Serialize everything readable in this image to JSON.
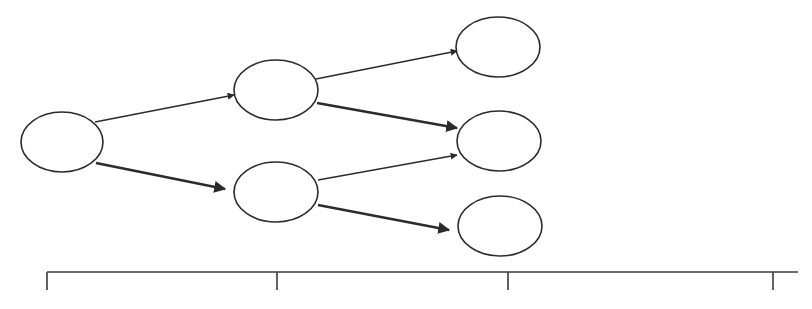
{
  "diagram": {
    "type": "tree",
    "colors": {
      "stroke": "#2b2b2b",
      "background": "#ffffff"
    },
    "nodes": [
      {
        "id": "n0",
        "label": "",
        "cx": 62,
        "cy": 142,
        "rx": 41,
        "ry": 30
      },
      {
        "id": "n1",
        "label": "",
        "cx": 276,
        "cy": 90,
        "rx": 42,
        "ry": 30
      },
      {
        "id": "n2",
        "label": "",
        "cx": 276,
        "cy": 192,
        "rx": 42,
        "ry": 30
      },
      {
        "id": "n3",
        "label": "",
        "cx": 498,
        "cy": 47,
        "rx": 42,
        "ry": 30
      },
      {
        "id": "n4",
        "label": "",
        "cx": 499,
        "cy": 141,
        "rx": 42,
        "ry": 30
      },
      {
        "id": "n5",
        "label": "",
        "cx": 500,
        "cy": 226,
        "rx": 42,
        "ry": 30
      }
    ],
    "edges": [
      {
        "from": "n0",
        "to": "n1",
        "weight": "thin",
        "x1": 95,
        "y1": 122,
        "x2": 234,
        "y2": 95
      },
      {
        "from": "n0",
        "to": "n2",
        "weight": "thick",
        "x1": 96,
        "y1": 163,
        "x2": 225,
        "y2": 189
      },
      {
        "from": "n1",
        "to": "n3",
        "weight": "thin",
        "x1": 316,
        "y1": 79,
        "x2": 457,
        "y2": 51
      },
      {
        "from": "n1",
        "to": "n4",
        "weight": "thick",
        "x1": 317,
        "y1": 103,
        "x2": 457,
        "y2": 128
      },
      {
        "from": "n2",
        "to": "n4",
        "weight": "thin",
        "x1": 318,
        "y1": 180,
        "x2": 457,
        "y2": 155
      },
      {
        "from": "n2",
        "to": "n5",
        "weight": "thick",
        "x1": 318,
        "y1": 205,
        "x2": 449,
        "y2": 230
      }
    ],
    "timeline": {
      "y": 272,
      "x_start": 47,
      "x_end": 798,
      "ticks": [
        {
          "x": 47,
          "label": ""
        },
        {
          "x": 277,
          "label": ""
        },
        {
          "x": 508,
          "label": ""
        },
        {
          "x": 773,
          "label": ""
        }
      ],
      "tick_length": 18
    }
  }
}
